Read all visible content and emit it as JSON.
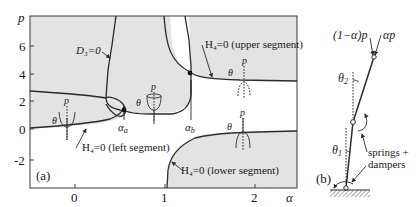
{
  "panel_a": {
    "label": "(a)",
    "axes": {
      "x_label": "α",
      "y_label": "p",
      "x_ticks": [
        "0",
        "1",
        "2"
      ],
      "y_ticks": [
        "6",
        "4",
        "2",
        "0",
        "-2"
      ]
    },
    "curves": {
      "d3": "D₃=0",
      "h4_upper": "H₄=0 (upper segment)",
      "h4_left": "H₄=0 (left segment)",
      "h4_lower": "H₄=0 (lower segment)"
    },
    "points": {
      "alpha_a": "α",
      "alpha_a_sub": "a",
      "alpha_b": "α",
      "alpha_b_sub": "b"
    },
    "glyph_labels": {
      "p": "p",
      "theta": "θ"
    },
    "colors": {
      "shaded_region": "#e3e3e3",
      "line": "#2a2a2a"
    }
  },
  "panel_b": {
    "label": "(b)",
    "load_left": "(1−α)p",
    "load_right": "αp",
    "theta2": "θ",
    "theta2_sub": "2",
    "theta1": "θ",
    "theta1_sub": "1",
    "springs_line1": "springs +",
    "springs_line2": "dampers"
  }
}
